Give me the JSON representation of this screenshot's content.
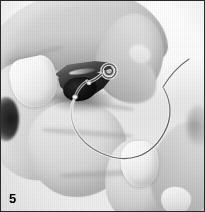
{
  "figure": {
    "kind": "photograph",
    "color_mode": "grayscale",
    "step_number": "5",
    "width_px": 205,
    "height_px": 212,
    "border_color": "#2b2b2b",
    "background_color": "#f2f2f2",
    "alt_text": "Black and white instructional photo, step 5: hands holding a thin wire that forms a large loop, with a small dark clamp gripped between the fingertips."
  },
  "elements": {
    "upper_hand_label": "upper-hand",
    "lower_hand_label": "lower-hand",
    "clamp_label": "dark-clamp",
    "wire_label": "wire-loop",
    "nail_upper_label": "thumb-nail-upper-left",
    "nail_lower_label": "thumb-nail-lower-centre"
  },
  "palette": {
    "highlight": "#ffffff",
    "skin_light": "#ededed",
    "skin_mid": "#d2d2d2",
    "skin_shadow": "#a8a8a8",
    "clamp_dark": "#0c0c0c",
    "wire": "#5a5a5a",
    "label_text": "#000000"
  }
}
